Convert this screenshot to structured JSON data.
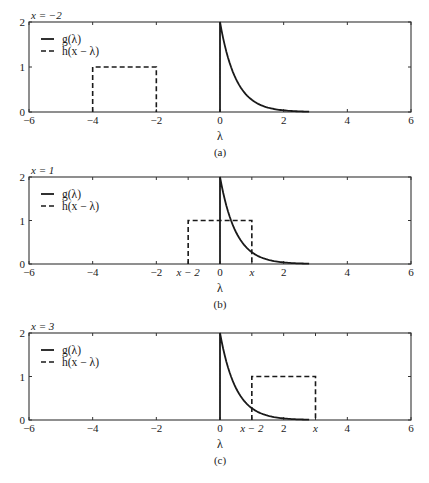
{
  "figure": {
    "width": 429,
    "height": 483,
    "colors": {
      "line": "#1a1a1a",
      "frame": "#333333",
      "background": "#ffffff"
    },
    "plot_left_px": 29,
    "plot_right_px": 411
  },
  "chart_data": [
    {
      "type": "line",
      "panel_id": "a",
      "caption": "(a)",
      "title": "x = −2",
      "xlabel": "λ",
      "ylabel": "",
      "xlim": [
        -6,
        6
      ],
      "ylim": [
        0,
        2
      ],
      "xticks": [
        -6,
        -4,
        -2,
        0,
        2,
        4,
        6
      ],
      "xtick_labels": [
        "−6",
        "−4",
        "−2",
        "0",
        "2",
        "4",
        "6"
      ],
      "yticks": [
        0,
        1,
        2
      ],
      "ytick_labels": [
        "0",
        "1",
        "2"
      ],
      "extra_xtick_labels": [],
      "grid": false,
      "legend": {
        "position": "upper left",
        "entries": [
          "g(λ)",
          "h(x − λ)"
        ]
      },
      "series": [
        {
          "name": "g(λ)",
          "style": "solid",
          "description": "2·e^(−2λ)·u(λ)",
          "x": [
            0,
            0,
            0.25,
            0.5,
            0.75,
            1.0,
            1.25,
            1.5,
            1.75,
            2.0,
            2.25,
            2.5,
            2.8
          ],
          "y": [
            0,
            2,
            1.21,
            0.74,
            0.45,
            0.27,
            0.16,
            0.1,
            0.06,
            0.04,
            0.02,
            0.01,
            0.0
          ]
        },
        {
          "name": "h(x − λ)",
          "style": "dashed",
          "x": [
            -4,
            -4,
            -2,
            -2
          ],
          "y": [
            0,
            1,
            1,
            0
          ]
        }
      ],
      "layout": {
        "top": 22,
        "bottom": 112
      }
    },
    {
      "type": "line",
      "panel_id": "b",
      "caption": "(b)",
      "title": "x = 1",
      "xlabel": "λ",
      "ylabel": "",
      "xlim": [
        -6,
        6
      ],
      "ylim": [
        0,
        2
      ],
      "xticks": [
        -6,
        -4,
        -2,
        -1,
        0,
        1,
        2,
        4,
        6
      ],
      "xtick_labels": [
        "−6",
        "−4",
        "−2",
        "x − 2",
        "0",
        "x",
        "2",
        "4",
        "6"
      ],
      "yticks": [
        0,
        1,
        2
      ],
      "ytick_labels": [
        "0",
        "1",
        "2"
      ],
      "grid": false,
      "legend": {
        "position": "upper left",
        "entries": [
          "g(λ)",
          "h(x − λ)"
        ]
      },
      "series": [
        {
          "name": "g(λ)",
          "style": "solid",
          "description": "2·e^(−2λ)·u(λ)",
          "x": [
            0,
            0,
            0.25,
            0.5,
            0.75,
            1.0,
            1.25,
            1.5,
            1.75,
            2.0,
            2.25,
            2.5,
            2.8
          ],
          "y": [
            0,
            2,
            1.21,
            0.74,
            0.45,
            0.27,
            0.16,
            0.1,
            0.06,
            0.04,
            0.02,
            0.01,
            0.0
          ]
        },
        {
          "name": "h(x − λ)",
          "style": "dashed",
          "x": [
            -1,
            -1,
            1,
            1
          ],
          "y": [
            0,
            1,
            1,
            0
          ]
        }
      ],
      "layout": {
        "top": 177,
        "bottom": 264
      }
    },
    {
      "type": "line",
      "panel_id": "c",
      "caption": "(c)",
      "title": "x = 3",
      "xlabel": "λ",
      "ylabel": "",
      "xlim": [
        -6,
        6
      ],
      "ylim": [
        0,
        2
      ],
      "xticks": [
        -6,
        -4,
        -2,
        0,
        1,
        2,
        3,
        4,
        6
      ],
      "xtick_labels": [
        "−6",
        "−4",
        "−2",
        "0",
        "x − 2",
        "2",
        "x",
        "4",
        "6"
      ],
      "yticks": [
        0,
        1,
        2
      ],
      "ytick_labels": [
        "0",
        "1",
        "2"
      ],
      "grid": false,
      "legend": {
        "position": "upper left",
        "entries": [
          "g(λ)",
          "h(x − λ)"
        ]
      },
      "series": [
        {
          "name": "g(λ)",
          "style": "solid",
          "description": "2·e^(−2λ)·u(λ)",
          "x": [
            0,
            0,
            0.25,
            0.5,
            0.75,
            1.0,
            1.25,
            1.5,
            1.75,
            2.0,
            2.25,
            2.5,
            2.8
          ],
          "y": [
            0,
            2,
            1.21,
            0.74,
            0.45,
            0.27,
            0.16,
            0.1,
            0.06,
            0.04,
            0.02,
            0.01,
            0.0
          ]
        },
        {
          "name": "h(x − λ)",
          "style": "dashed",
          "x": [
            1,
            1,
            3,
            3
          ],
          "y": [
            0,
            1,
            1,
            0
          ]
        }
      ],
      "layout": {
        "top": 333,
        "bottom": 420
      }
    }
  ]
}
